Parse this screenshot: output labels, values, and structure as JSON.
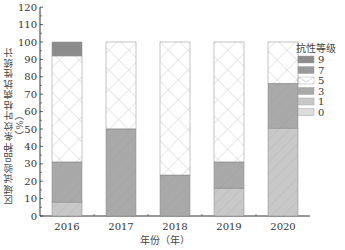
{
  "chart_data": {
    "type": "bar",
    "stacked": true,
    "title": "",
    "xlabel": "年份（年）",
    "ylabel": "区域试验品种条纹叶枯病抗性统计（%）",
    "ylim": [
      0,
      120
    ],
    "yticks": [
      0,
      10,
      20,
      30,
      40,
      50,
      60,
      70,
      80,
      90,
      100,
      110,
      120
    ],
    "categories": [
      "2016",
      "2017",
      "2018",
      "2019",
      "2020"
    ],
    "legend_title": "抗性等级",
    "legend_position": "right",
    "grid": false,
    "series": [
      {
        "name": "0",
        "values": [
          0,
          0,
          0,
          0,
          0
        ],
        "color": "#dcdcdc",
        "pattern": "light-diagonal"
      },
      {
        "name": "1",
        "values": [
          8,
          0,
          0,
          16,
          50.5
        ],
        "color": "#c8c8c8",
        "pattern": "diagonal"
      },
      {
        "name": "3",
        "values": [
          23,
          50,
          23.5,
          15,
          25.5
        ],
        "color": "#a9a9a9",
        "pattern": "diagonal"
      },
      {
        "name": "5",
        "values": [
          61,
          50,
          76.5,
          69,
          24
        ],
        "color": "#ffffff",
        "pattern": "crosshatch"
      },
      {
        "name": "7",
        "values": [
          0,
          0,
          0,
          0,
          0
        ],
        "color": "#9a9a9a",
        "pattern": "diagonal"
      },
      {
        "name": "9",
        "values": [
          8,
          0,
          0,
          0,
          0
        ],
        "color": "#8c8c8c",
        "pattern": "solid"
      }
    ]
  },
  "labels": {
    "ylabel": "区域试验品种条纹叶枯病抗性统计（%）",
    "xlabel": "年份（年）",
    "legend_title": "抗性等级"
  }
}
